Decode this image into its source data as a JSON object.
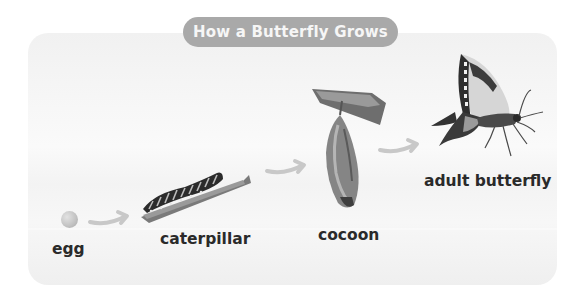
{
  "title": "How a Butterfly Grows",
  "stages": [
    {
      "id": "egg",
      "label": "egg"
    },
    {
      "id": "caterpillar",
      "label": "caterpillar"
    },
    {
      "id": "cocoon",
      "label": "cocoon"
    },
    {
      "id": "adult",
      "label": "adult butterfly"
    }
  ],
  "arrows": [
    "egg-to-caterpillar",
    "caterpillar-to-cocoon",
    "cocoon-to-adult"
  ],
  "colors": {
    "title_pill": "#a9a9a9",
    "title_text": "#f6f6f6",
    "label_text": "#2a2a2a",
    "arrow": "#c8c8c8"
  }
}
